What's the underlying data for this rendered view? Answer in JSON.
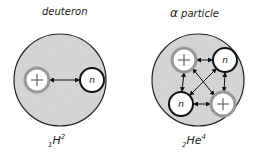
{
  "deuteron": {
    "title": "deuteron",
    "formula": {
      "pre_sub": "1",
      "symbol": "H",
      "sup": "2"
    },
    "particles": [
      {
        "type": "proton",
        "label": "+"
      },
      {
        "type": "neutron",
        "label": "n"
      }
    ]
  },
  "alpha": {
    "title_symbol": "α",
    "title_text": " particle",
    "formula": {
      "pre_sub": "2",
      "symbol": "He",
      "sup": "4"
    },
    "particles": [
      {
        "type": "proton",
        "label": "+"
      },
      {
        "type": "neutron",
        "label": "n"
      },
      {
        "type": "neutron",
        "label": "n"
      },
      {
        "type": "proton",
        "label": "+"
      }
    ]
  },
  "colors": {
    "nucleus_fill": "#cfcfcf",
    "outline": "#111111",
    "proton_ring": "#9a9a9a"
  }
}
